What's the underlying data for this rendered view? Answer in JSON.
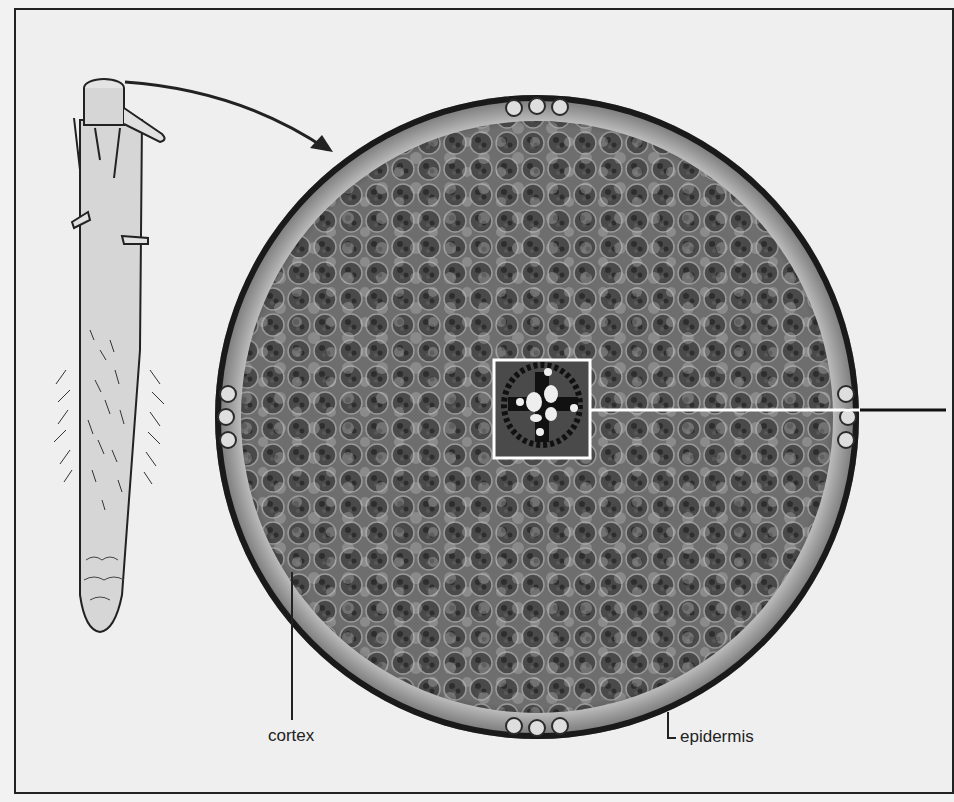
{
  "figure": {
    "labels": {
      "cortex": "cortex",
      "epidermis": "epidermis"
    },
    "colors": {
      "background": "#efefef",
      "frame": "#222222",
      "root_fill": "#d8d8d8",
      "section_dark": "#3a3a3a",
      "section_mid": "#777777",
      "cell_light": "#d9d9d9",
      "highlight_box": "#ffffff"
    }
  }
}
